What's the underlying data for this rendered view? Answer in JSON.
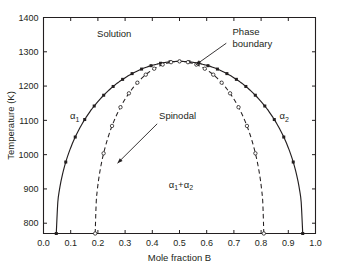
{
  "chart_data": {
    "type": "line",
    "title": "",
    "xlabel": "Mole fraction B",
    "ylabel": "Temperature (K)",
    "xlim": [
      0.0,
      1.0
    ],
    "ylim": [
      770,
      1400
    ],
    "grid": false,
    "legend_position": "none",
    "x_ticks": [
      "0.0",
      "0.1",
      "0.2",
      "0.3",
      "0.4",
      "0.5",
      "0.6",
      "0.7",
      "0.8",
      "0.9",
      "1.0"
    ],
    "x_tick_values": [
      0.0,
      0.1,
      0.2,
      0.3,
      0.4,
      0.5,
      0.6,
      0.7,
      0.8,
      0.9,
      1.0
    ],
    "y_ticks": [
      "800",
      "900",
      "1000",
      "1100",
      "1200",
      "1300",
      "1400"
    ],
    "y_tick_values": [
      800,
      900,
      1000,
      1100,
      1200,
      1300,
      1400
    ],
    "series": [
      {
        "name": "Phase boundary",
        "style": "solid",
        "marker": "filled-square",
        "x": [
          0.047,
          0.062,
          0.08,
          0.1,
          0.124,
          0.152,
          0.183,
          0.218,
          0.258,
          0.302,
          0.35,
          0.4,
          0.45,
          0.5,
          0.55,
          0.6,
          0.65,
          0.698,
          0.742,
          0.782,
          0.817,
          0.848,
          0.876,
          0.9,
          0.92,
          0.938,
          0.95
        ],
        "y": [
          770,
          800,
          835,
          870,
          905,
          940,
          975,
          1010,
          1045,
          1080,
          1115,
          1150,
          1180,
          1210,
          1235,
          1253,
          1266,
          1272,
          1266,
          1253,
          1235,
          1210,
          1180,
          1150,
          1115,
          1080,
          1045
        ],
        "x_sorted": [
          0.047,
          0.062,
          0.08,
          0.1,
          0.124,
          0.152,
          0.183,
          0.218,
          0.258,
          0.302,
          0.35,
          0.405,
          0.452,
          0.5,
          0.548,
          0.595,
          0.642,
          0.698,
          0.742,
          0.782,
          0.818,
          0.85,
          0.876,
          0.9,
          0.921,
          0.938,
          0.953
        ],
        "y_sorted": [
          770,
          800,
          840,
          875,
          912,
          948,
          983,
          1018,
          1052,
          1088,
          1122,
          1160,
          1198,
          1228,
          1258,
          1268,
          1272,
          1268,
          1258,
          1240,
          1222,
          1196,
          1164,
          1126,
          1084,
          1035,
          980
        ]
      },
      {
        "name": "Spinodal",
        "style": "dashed",
        "marker": "open-circle",
        "x": [
          0.19,
          0.205,
          0.228,
          0.252,
          0.278,
          0.308,
          0.342,
          0.38,
          0.42,
          0.462,
          0.5,
          0.538,
          0.58,
          0.62,
          0.658,
          0.692,
          0.722,
          0.748,
          0.772,
          0.792,
          0.81
        ],
        "y": [
          770,
          800,
          840,
          880,
          918,
          955,
          995,
          1050,
          1110,
          1185,
          1262,
          1185,
          1110,
          1050,
          995,
          955,
          918,
          880,
          840,
          800,
          770
        ]
      }
    ],
    "curves": {
      "binodal": {
        "label": "Phase boundary",
        "critical_x": 0.5,
        "critical_T": 1272,
        "left_foot_x": 0.047,
        "right_foot_x": 0.953,
        "foot_T": 770
      },
      "spinodal": {
        "label": "Spinodal",
        "critical_x": 0.5,
        "critical_T": 1272,
        "left_foot_x": 0.19,
        "right_foot_x": 0.81,
        "foot_T": 770
      }
    },
    "annotations": [
      {
        "name": "phase-boundary-annotation",
        "text_line1": "Phase",
        "text_line2": "boundary",
        "target_x": 0.56,
        "target_y": 1262
      },
      {
        "name": "spinodal-annotation",
        "text": "Spinodal",
        "target_x": 0.272,
        "target_y": 975
      }
    ],
    "region_labels": [
      {
        "name": "solution-region-label",
        "text": "Solution",
        "x": 0.26,
        "y": 1345
      },
      {
        "name": "alpha1-region-label",
        "alpha": "α",
        "subscript": "1",
        "x": 0.115,
        "y": 1105
      },
      {
        "name": "alpha2-region-label",
        "alpha": "α",
        "subscript": "2",
        "x": 0.885,
        "y": 1105
      },
      {
        "name": "two-phase-region-label",
        "text_alpha": "α",
        "sub1": "1",
        "plus": "+",
        "sub2": "2",
        "x": 0.505,
        "y": 905
      }
    ]
  },
  "labels": {
    "x_axis_title": "Mole fraction B",
    "y_axis_title": "Temperature (K)",
    "solution": "Solution",
    "phase_boundary_l1": "Phase",
    "phase_boundary_l2": "boundary",
    "spinodal": "Spinodal",
    "alpha": "α",
    "alpha_sub_1": "1",
    "alpha_sub_2": "2",
    "plus": "+",
    "x_tick_0": "0.0",
    "x_tick_1": "0.1",
    "x_tick_2": "0.2",
    "x_tick_3": "0.3",
    "x_tick_4": "0.4",
    "x_tick_5": "0.5",
    "x_tick_6": "0.6",
    "x_tick_7": "0.7",
    "x_tick_8": "0.8",
    "x_tick_9": "0.9",
    "x_tick_10": "1.0",
    "y_tick_800": "800",
    "y_tick_900": "900",
    "y_tick_1000": "1000",
    "y_tick_1100": "1100",
    "y_tick_1200": "1200",
    "y_tick_1300": "1300",
    "y_tick_1400": "1400"
  },
  "colors": {
    "ink": "#231f20",
    "background": "#ffffff",
    "marker_fill": "#231f20",
    "marker_open_fill": "#ffffff"
  }
}
